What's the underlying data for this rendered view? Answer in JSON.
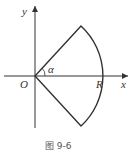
{
  "diagram": {
    "labels": {
      "y_axis": "y",
      "x_axis": "x",
      "origin": "O",
      "radius": "R",
      "angle": "α"
    },
    "caption": "图 9-6",
    "colors": {
      "stroke": "#333333",
      "background": "#ffffff"
    }
  }
}
